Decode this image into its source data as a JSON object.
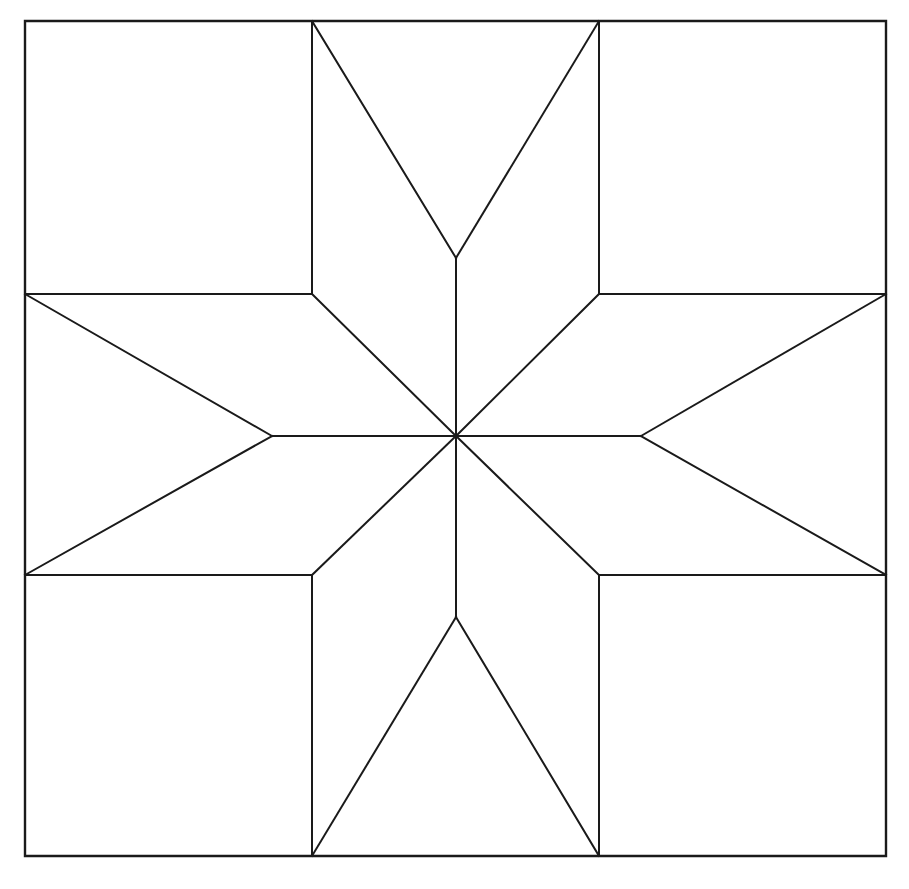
{
  "figure": {
    "background_color": "#ffffff",
    "line_color": "#1a1a1a",
    "fill_color": "#ffffff",
    "line_width_px": 2,
    "canvas": {
      "width": 909,
      "height": 889
    }
  },
  "geometry": {
    "frame": {
      "left": 25,
      "top": 21,
      "right": 886,
      "bottom": 856,
      "width": 861,
      "height": 835
    },
    "grid": {
      "vertical_x": [
        25,
        312,
        599,
        886
      ],
      "horizontal_y": [
        21,
        294,
        575,
        856
      ]
    },
    "center": {
      "x": 456,
      "y": 436
    },
    "star_tips": {
      "top": {
        "x": 456,
        "y": 21
      },
      "bottom": {
        "x": 456,
        "y": 856
      },
      "left": {
        "x": 25,
        "y": 436
      },
      "right": {
        "x": 886,
        "y": 436
      },
      "top_left_diagonal": {
        "x": 25,
        "y": 294
      },
      "top_right_diagonal": {
        "x": 886,
        "y": 294
      },
      "bottom_left_diagonal": {
        "x": 25,
        "y": 575
      },
      "bottom_right_diagonal": {
        "x": 886,
        "y": 575
      }
    },
    "inner_notch_vertices": {
      "top": {
        "x": 456,
        "y": 258
      },
      "bottom": {
        "x": 456,
        "y": 617
      },
      "left": {
        "x": 272,
        "y": 436
      },
      "right": {
        "x": 641,
        "y": 436
      }
    },
    "octagon_corners": {
      "top_left": {
        "x": 312,
        "y": 294
      },
      "top_right": {
        "x": 599,
        "y": 294
      },
      "bottom_left": {
        "x": 312,
        "y": 575
      },
      "bottom_right": {
        "x": 599,
        "y": 575
      }
    },
    "point_count": 8,
    "corner_square_count": 4,
    "side_rectangle_count": 4
  },
  "paths": {
    "frame": "M 25 21 L 886 21 L 886 856 L 25 856 Z",
    "grid_vertical_left": "M 312 21 L 312 294 M 312 575 L 312 856",
    "grid_vertical_right": "M 599 21 L 599 294 M 599 575 L 599 856",
    "grid_horizontal_top": "M 25 294 L 312 294 M 599 294 L 886 294",
    "grid_horizontal_bottom": "M 25 575 L 312 575 M 599 575 L 886 575",
    "point_north_left": "M 312 21 L 456 258",
    "point_north_right": "M 599 21 L 456 258",
    "point_north_stem": "M 456 258 L 456 436",
    "point_south_left": "M 312 856 L 456 617",
    "point_south_right": "M 599 856 L 456 617",
    "point_south_stem": "M 456 617 L 456 436",
    "point_west_top": "M 25 294 L 272 436",
    "point_west_bottom": "M 25 575 L 272 436",
    "point_west_stem": "M 272 436 L 456 436",
    "point_east_top": "M 886 294 L 641 436",
    "point_east_bottom": "M 886 575 L 641 436",
    "point_east_stem": "M 641 436 L 456 436",
    "point_northwest": "M 312 294 L 456 436",
    "point_northeast": "M 599 294 L 456 436",
    "point_southwest": "M 312 575 L 456 436",
    "point_southeast": "M 599 575 L 456 436",
    "inner_hline_left": "M 25 294 L 312 294",
    "inner_hline_right": "M 599 294 L 886 294"
  },
  "regions": {
    "corner_squares": [
      {
        "name": "top-left-corner-square",
        "points": "25,21 312,21 312,294 25,294"
      },
      {
        "name": "top-right-corner-square",
        "points": "599,21 886,21 886,294 599,294"
      },
      {
        "name": "bottom-left-corner-square",
        "points": "25,575 312,575 312,856 25,856"
      },
      {
        "name": "bottom-right-corner-square",
        "points": "599,575 886,575 886,856 599,856"
      }
    ],
    "star_points": [
      {
        "name": "star-point-north-west-half",
        "points": "312,21 456,258 456,436 312,294"
      },
      {
        "name": "star-point-north-east-half",
        "points": "599,21 599,294 456,436 456,258"
      },
      {
        "name": "star-point-south-west-half",
        "points": "312,856 312,575 456,436 456,617"
      },
      {
        "name": "star-point-south-east-half",
        "points": "599,856 456,617 456,436 599,575"
      },
      {
        "name": "star-point-west-upper-half",
        "points": "25,294 272,436 456,436 312,294"
      },
      {
        "name": "star-point-west-lower-half",
        "points": "25,575 312,575 456,436 272,436"
      },
      {
        "name": "star-point-east-upper-half",
        "points": "886,294 599,294 456,436 641,436"
      },
      {
        "name": "star-point-east-lower-half",
        "points": "886,575 641,436 456,436 599,575"
      }
    ]
  }
}
